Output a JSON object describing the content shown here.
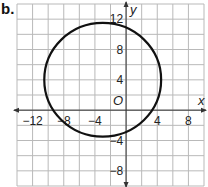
{
  "problem_label": "b.",
  "chart_data": {
    "type": "line",
    "title": "",
    "xlabel": "x",
    "ylabel": "y",
    "origin_label": "O",
    "xlim": [
      -14,
      10
    ],
    "ylim": [
      -10,
      14
    ],
    "grid": true,
    "grid_step": 2,
    "x_ticks": [
      {
        "value": -12,
        "label": "−12"
      },
      {
        "value": -8,
        "label": "−8"
      },
      {
        "value": -4,
        "label": "−4"
      },
      {
        "value": 4,
        "label": "4"
      },
      {
        "value": 8,
        "label": "8"
      }
    ],
    "y_ticks": [
      {
        "value": 12,
        "label": "12"
      },
      {
        "value": 8,
        "label": "8"
      },
      {
        "value": 4,
        "label": "4"
      },
      {
        "value": -4,
        "label": "−4"
      },
      {
        "value": -8,
        "label": "−8"
      }
    ],
    "series": [
      {
        "name": "circle",
        "shape": "circle",
        "center": [
          -3,
          4
        ],
        "radius": 7.5
      }
    ]
  }
}
